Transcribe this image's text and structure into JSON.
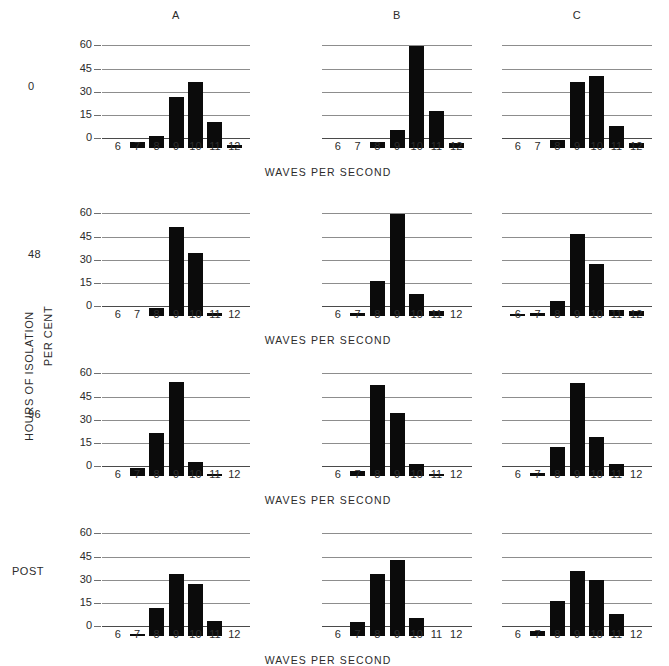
{
  "axes": {
    "y_label": "PER CENT",
    "y_ticks": [
      0,
      15,
      30,
      45,
      60
    ],
    "y_max": 70,
    "x_label": "WAVES PER SECOND",
    "x_ticks": [
      6,
      7,
      8,
      9,
      10,
      11,
      12
    ]
  },
  "row_group_label": "HOURS OF ISOLATION",
  "panel_titles": [
    "A",
    "B",
    "C"
  ],
  "row_labels": [
    "0",
    "48",
    "96",
    "POST"
  ],
  "chart_data": {
    "type": "bar",
    "title": "",
    "xlabel": "WAVES PER SECOND",
    "ylabel": "PER CENT",
    "ylim": [
      0,
      70
    ],
    "grid": true,
    "legend": "none",
    "categories": [
      6,
      7,
      8,
      9,
      10,
      11,
      12
    ],
    "row_variable": "HOURS OF ISOLATION",
    "column_variable": "subject",
    "columns": [
      "A",
      "B",
      "C"
    ],
    "rows": [
      "0",
      "48",
      "96",
      "POST"
    ],
    "panels": [
      {
        "row": "0",
        "column": "A",
        "values": [
          0,
          4,
          8,
          33,
          43,
          17,
          2
        ]
      },
      {
        "row": "0",
        "column": "B",
        "values": [
          0,
          0,
          4,
          12,
          66,
          24,
          3
        ]
      },
      {
        "row": "0",
        "column": "C",
        "values": [
          0,
          0,
          5,
          43,
          47,
          14,
          3
        ]
      },
      {
        "row": "48",
        "column": "A",
        "values": [
          0,
          0,
          5,
          58,
          41,
          2,
          0
        ]
      },
      {
        "row": "48",
        "column": "B",
        "values": [
          0,
          2,
          23,
          66,
          14,
          3,
          0
        ]
      },
      {
        "row": "48",
        "column": "C",
        "values": [
          1,
          2,
          10,
          53,
          34,
          4,
          3
        ]
      },
      {
        "row": "96",
        "column": "A",
        "values": [
          0,
          5,
          28,
          61,
          9,
          1,
          0
        ]
      },
      {
        "row": "96",
        "column": "B",
        "values": [
          0,
          3,
          59,
          41,
          8,
          1,
          0
        ]
      },
      {
        "row": "96",
        "column": "C",
        "values": [
          0,
          2,
          19,
          60,
          25,
          8,
          0
        ]
      },
      {
        "row": "POST",
        "column": "A",
        "values": [
          0,
          1,
          18,
          40,
          34,
          10,
          0
        ]
      },
      {
        "row": "POST",
        "column": "B",
        "values": [
          0,
          9,
          40,
          49,
          12,
          0,
          0
        ]
      },
      {
        "row": "POST",
        "column": "C",
        "values": [
          0,
          3,
          23,
          42,
          36,
          14,
          0
        ]
      }
    ]
  }
}
